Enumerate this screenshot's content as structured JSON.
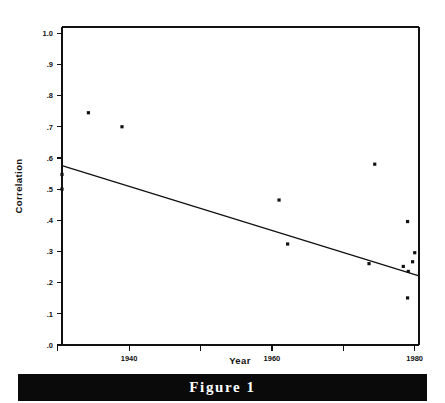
{
  "figure": {
    "caption": "Figure 1"
  },
  "chart_data": {
    "type": "scatter",
    "title": "",
    "xlabel": "Year",
    "ylabel": "Correlation",
    "xlim": [
      1930.6,
      1980.6
    ],
    "ylim": [
      0.0,
      1.02
    ],
    "grid": false,
    "legend": null,
    "x_ticks": [
      {
        "value": 1930,
        "label": ""
      },
      {
        "value": 1940,
        "label": "1940"
      },
      {
        "value": 1950,
        "label": ""
      },
      {
        "value": 1960,
        "label": "1960"
      },
      {
        "value": 1970,
        "label": ""
      },
      {
        "value": 1980,
        "label": "1980"
      }
    ],
    "y_ticks": [
      {
        "value": 0.0,
        "label": ".0"
      },
      {
        "value": 0.1,
        "label": ".1"
      },
      {
        "value": 0.2,
        "label": ".2"
      },
      {
        "value": 0.3,
        "label": ".3"
      },
      {
        "value": 0.4,
        "label": ".4"
      },
      {
        "value": 0.5,
        "label": ".5"
      },
      {
        "value": 0.6,
        "label": ".6"
      },
      {
        "value": 0.7,
        "label": ".7"
      },
      {
        "value": 0.8,
        "label": ".8"
      },
      {
        "value": 0.9,
        "label": ".9"
      },
      {
        "value": 1.0,
        "label": "1.0"
      }
    ],
    "points": [
      {
        "x": 1930.6,
        "y": 0.547
      },
      {
        "x": 1930.6,
        "y": 0.5
      },
      {
        "x": 1934.3,
        "y": 0.745
      },
      {
        "x": 1939.0,
        "y": 0.7
      },
      {
        "x": 1961.0,
        "y": 0.465
      },
      {
        "x": 1962.2,
        "y": 0.324
      },
      {
        "x": 1973.6,
        "y": 0.261
      },
      {
        "x": 1974.4,
        "y": 0.58
      },
      {
        "x": 1978.4,
        "y": 0.252
      },
      {
        "x": 1979.0,
        "y": 0.396
      },
      {
        "x": 1979.0,
        "y": 0.151
      },
      {
        "x": 1979.1,
        "y": 0.236
      },
      {
        "x": 1979.7,
        "y": 0.267
      },
      {
        "x": 1980.0,
        "y": 0.296
      }
    ],
    "trend_line": {
      "x_start": 1930.6,
      "y_start": 0.575,
      "x_end": 1980.6,
      "y_end": 0.222
    },
    "colors": {
      "ink": "#111111",
      "background": "#ffffff",
      "caption_bar": "#0a0a0a",
      "caption_text": "#ffffff"
    }
  }
}
